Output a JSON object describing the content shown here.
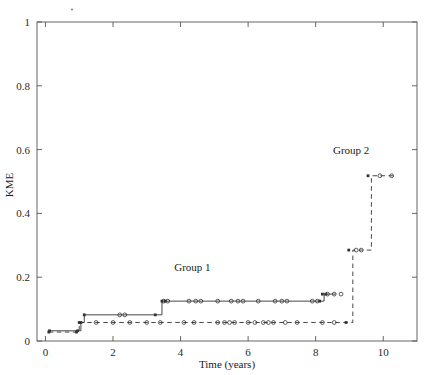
{
  "chart_data": {
    "type": "line",
    "title": "",
    "xlabel": "Time (years)",
    "ylabel": "KME",
    "xlim": [
      -0.25,
      11.0
    ],
    "ylim": [
      0,
      1
    ],
    "xticks": [
      0,
      2,
      4,
      6,
      8,
      10
    ],
    "xticklabels": [
      "0",
      "2",
      "4",
      "6",
      "8",
      "10"
    ],
    "yticks": [
      0,
      0.2,
      0.4,
      0.6,
      0.8,
      1
    ],
    "yticklabels": [
      "0",
      "0.2",
      "0.4",
      "0.6",
      "0.8",
      "1"
    ],
    "grid": false,
    "legend_position": "inline-annotations",
    "annotations": [
      {
        "text": "Group 1",
        "x": 4.35,
        "y": 0.218
      },
      {
        "text": "Group 2",
        "x": 9.05,
        "y": 0.585
      }
    ],
    "series": [
      {
        "name": "Group 1",
        "style": "solid",
        "color": "#333333",
        "step": "post",
        "x": [
          0.12,
          0.95,
          1.05,
          1.15,
          1.35,
          3.25,
          3.45,
          8.15,
          8.25,
          8.6
        ],
        "y": [
          0.032,
          0.032,
          0.058,
          0.082,
          0.082,
          0.082,
          0.125,
          0.125,
          0.147,
          0.147
        ],
        "event_marks": {
          "x": [
            0.12,
            0.95,
            1.05,
            1.15,
            3.25,
            3.45,
            3.55,
            8.12,
            8.2,
            8.3
          ],
          "y": [
            0.032,
            0.032,
            0.058,
            0.082,
            0.082,
            0.125,
            0.125,
            0.125,
            0.147,
            0.147
          ]
        },
        "censor_marks": {
          "x": [
            2.2,
            2.35,
            3.5,
            3.62,
            4.25,
            4.45,
            4.6,
            5.1,
            5.5,
            5.7,
            5.85,
            6.3,
            6.8,
            7.0,
            7.15,
            7.9,
            8.05,
            8.35,
            8.55,
            8.75
          ],
          "y": [
            0.082,
            0.082,
            0.125,
            0.125,
            0.125,
            0.125,
            0.125,
            0.125,
            0.125,
            0.125,
            0.125,
            0.125,
            0.125,
            0.125,
            0.125,
            0.125,
            0.125,
            0.147,
            0.147,
            0.147
          ]
        }
      },
      {
        "name": "Group 2",
        "style": "dashed",
        "color": "#333333",
        "step": "post",
        "x": [
          0.1,
          0.95,
          1.0,
          9.0,
          9.1,
          9.55,
          9.65,
          10.3
        ],
        "y": [
          0.028,
          0.028,
          0.058,
          0.058,
          0.285,
          0.285,
          0.518,
          0.518
        ],
        "event_marks": {
          "x": [
            0.1,
            0.92,
            1.0,
            8.9,
            8.98,
            9.55
          ],
          "y": [
            0.028,
            0.028,
            0.058,
            0.058,
            0.285,
            0.518
          ]
        },
        "censor_marks": {
          "x": [
            1.5,
            2.0,
            2.5,
            3.0,
            3.4,
            4.1,
            4.4,
            5.1,
            5.3,
            5.45,
            5.6,
            6.0,
            6.2,
            6.45,
            6.6,
            6.75,
            7.1,
            7.45,
            8.2,
            8.55,
            9.2,
            9.35,
            9.9,
            10.25
          ],
          "y": [
            0.058,
            0.058,
            0.058,
            0.058,
            0.058,
            0.058,
            0.058,
            0.058,
            0.058,
            0.058,
            0.058,
            0.058,
            0.058,
            0.058,
            0.058,
            0.058,
            0.058,
            0.058,
            0.058,
            0.058,
            0.285,
            0.285,
            0.518,
            0.518
          ]
        }
      }
    ]
  },
  "axes": {
    "y_title": "KME",
    "x_title": "Time (years)"
  },
  "marks": {
    "speck": "plot-speck"
  },
  "colors": {
    "frame": "#555555",
    "line": "#333333",
    "text": "#1a1a1a"
  }
}
